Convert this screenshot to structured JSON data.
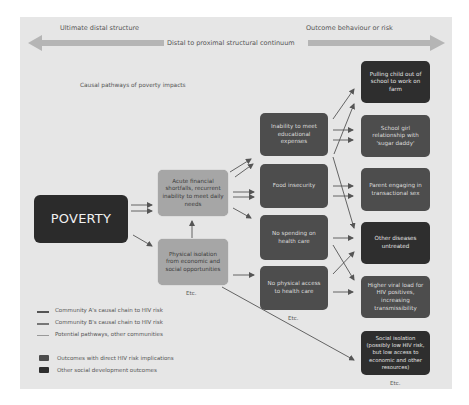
{
  "header": {
    "left_label": "Ultimate distal structure",
    "right_label": "Outcome behaviour or risk",
    "continuum_label": "Distal to proximal structural continuum"
  },
  "caption": "Causal pathways of poverty impacts",
  "root": {
    "label": "POVERTY"
  },
  "structural_factors": [
    {
      "label": "Acute financial shortfalls, recurrent inability to meet daily needs"
    },
    {
      "label": "Physical isolation from economic and social opportunities"
    }
  ],
  "structural_etc": "Etc.",
  "intermediate": [
    {
      "label": "Inability to meet educational expenses"
    },
    {
      "label": "Food insecurity"
    },
    {
      "label": "No spending on health care"
    },
    {
      "label": "No physical access to health care"
    }
  ],
  "intermediate_etc": "Etc.",
  "outcomes": [
    {
      "label": "Pulling child out of school to work on farm",
      "category": "other"
    },
    {
      "label": "School girl relationship with 'sugar daddy'",
      "category": "hiv"
    },
    {
      "label": "Parent engaging in transactional sex",
      "category": "hiv"
    },
    {
      "label": "Other diseases untreated",
      "category": "other"
    },
    {
      "label": "Higher viral load for HIV positives, increasing transmissibility",
      "category": "hiv"
    },
    {
      "label": "Social isolation (possibly low HIV risk, but low access to economic and other resources)",
      "category": "other"
    }
  ],
  "outcomes_etc": "Etc.",
  "legend": {
    "lines": [
      {
        "label": "Community A's causal chain to HIV risk",
        "color": "#555555"
      },
      {
        "label": "Community B's causal chain to HIV risk",
        "color": "#777777"
      },
      {
        "label": "Potential pathways, other communities",
        "color": "#999999"
      }
    ],
    "swatches": [
      {
        "label": "Outcomes with direct HIV risk implications",
        "color": "#4d4d4d"
      },
      {
        "label": "Other social development outcomes",
        "color": "#2e2e2e"
      }
    ]
  },
  "colors": {
    "panel_bg": "#e6e6e6",
    "light_box": "#a6a6a6",
    "hiv_box": "#4d4d4d",
    "other_box": "#2e2e2e",
    "continuum_arrow": "#b5b5b5"
  }
}
